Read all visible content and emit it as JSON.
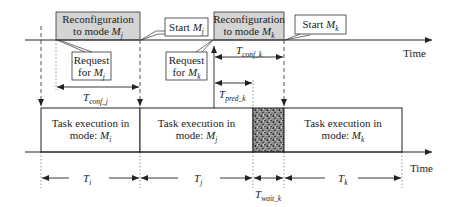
{
  "axes": {
    "top_time_label": "Time",
    "bottom_time_label": "Time"
  },
  "reconfig_boxes": [
    {
      "line1": "Reconfiguration",
      "line2_prefix": "to mode ",
      "mode_var": "M",
      "mode_sub": "j",
      "fill": "#d4d4d4"
    },
    {
      "line1": "Reconfiguration",
      "line2_prefix": "to mode ",
      "mode_var": "M",
      "mode_sub": "k",
      "fill": "#d4d4d4"
    }
  ],
  "callouts": [
    {
      "text": "Start ",
      "var": "M",
      "sub": "j"
    },
    {
      "text": "Start ",
      "var": "M",
      "sub": "k"
    },
    {
      "line1": "Request",
      "line2_prefix": "for ",
      "var": "M",
      "sub": "j"
    },
    {
      "line1": "Request",
      "line2_prefix": "for ",
      "var": "M",
      "sub": "k"
    }
  ],
  "intervals": {
    "t_conf_j": {
      "var": "T",
      "sub": "conf_j"
    },
    "t_conf_k": {
      "var": "T",
      "sub": "conf_k"
    },
    "t_pred_k": {
      "var": "T",
      "sub": "pred_k"
    },
    "t_wait_k": {
      "var": "T",
      "sub": "wait_k"
    },
    "t_i": {
      "var": "T",
      "sub": "i"
    },
    "t_j": {
      "var": "T",
      "sub": "j"
    },
    "t_k": {
      "var": "T",
      "sub": "k"
    }
  },
  "task_boxes": [
    {
      "line1": "Task execution in",
      "line2_prefix": "mode: ",
      "var": "M",
      "sub": "i"
    },
    {
      "line1": "Task execution in",
      "line2_prefix": "mode: ",
      "var": "M",
      "sub": "j"
    },
    {
      "line1": "Task execution in",
      "line2_prefix": "mode: ",
      "var": "M",
      "sub": "k"
    }
  ],
  "wait_block": {
    "pattern": "noise",
    "fill": "#6e6e6e"
  },
  "colors": {
    "line": "#222222",
    "reconfig_fill": "#d4d4d4",
    "dash": "#555555"
  }
}
